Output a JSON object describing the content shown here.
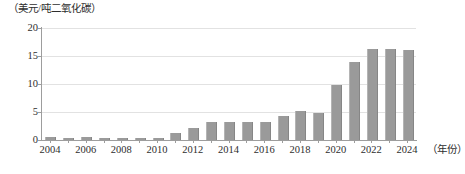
{
  "chart_data": {
    "type": "bar",
    "title": "",
    "subtitle": "",
    "ylabel": "（美元/吨二氧化碳）",
    "xlabel": "（年份）",
    "categories": [
      "2004",
      "2005",
      "2006",
      "2007",
      "2008",
      "2009",
      "2010",
      "2011",
      "2012",
      "2013",
      "2014",
      "2015",
      "2016",
      "2017",
      "2018",
      "2019",
      "2020",
      "2021",
      "2022",
      "2023",
      "2024"
    ],
    "values": [
      0.5,
      0.4,
      0.5,
      0.3,
      0.3,
      0.3,
      0.4,
      1.2,
      2.2,
      3.2,
      3.3,
      3.3,
      3.2,
      4.2,
      5.2,
      4.8,
      9.8,
      14.0,
      16.3,
      16.3,
      16.0
    ],
    "ylim": [
      0,
      20
    ],
    "ytick_labels": [
      "0",
      "5",
      "10",
      "15",
      "20"
    ],
    "ytick_values": [
      0,
      5,
      10,
      15,
      20
    ],
    "xtick_labels": [
      "2004",
      "2006",
      "2008",
      "2010",
      "2012",
      "2014",
      "2016",
      "2018",
      "2020",
      "2022",
      "2024"
    ],
    "xtick_values": [
      2004,
      2006,
      2008,
      2010,
      2012,
      2014,
      2016,
      2018,
      2020,
      2022,
      2024
    ],
    "grid": true,
    "grid_axis": "y",
    "legend": false,
    "legend_position": "none",
    "series": [
      {
        "name": "碳价",
        "color": "#9a9a9a",
        "values": [
          0.5,
          0.4,
          0.5,
          0.3,
          0.3,
          0.3,
          0.4,
          1.2,
          2.2,
          3.2,
          3.3,
          3.3,
          3.2,
          4.2,
          5.2,
          4.8,
          9.8,
          14.0,
          16.3,
          16.3,
          16.0
        ]
      }
    ],
    "colors": {
      "bar": "#9a9a9a",
      "grid": "#e2e2e2",
      "axis": "#9d9d9d",
      "text": "#2e2e2e",
      "background": "#ffffff"
    }
  }
}
